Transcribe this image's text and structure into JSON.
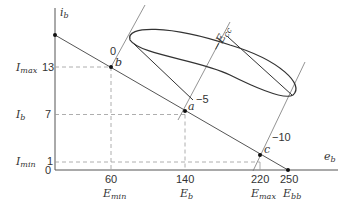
{
  "diagram": {
    "axes": {
      "y_label": "i",
      "y_label_sub": "b",
      "x_label": "e",
      "x_label_sub": "b",
      "origin": "0"
    },
    "y_ticks": [
      {
        "value": "13",
        "name": "I",
        "name_sub": "max"
      },
      {
        "value": "7",
        "name": "I",
        "name_sub": "b"
      },
      {
        "value": "1",
        "name": "I",
        "name_sub": "min"
      }
    ],
    "x_ticks": [
      {
        "value": "60",
        "name": "E",
        "name_sub": "min"
      },
      {
        "value": "140",
        "name": "E",
        "name_sub": "b"
      },
      {
        "value": "220",
        "name": "E",
        "name_sub": "max"
      },
      {
        "value": "250",
        "name": "E",
        "name_sub": "bb"
      }
    ],
    "points": {
      "a": "a",
      "b": "b",
      "c": "c"
    },
    "grid_axis": {
      "label": "−E",
      "label_sub": "cc",
      "tick_0": "0",
      "tick_minus5": "−5",
      "tick_minus10": "−10"
    },
    "colors": {
      "line": "#555555",
      "dashed": "#999999",
      "ellipse": "#333333"
    }
  }
}
